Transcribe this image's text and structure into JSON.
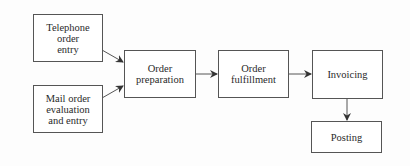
{
  "diagram": {
    "type": "flowchart",
    "nodes": [
      {
        "id": "telephone",
        "label": "Telephone\norder\nentry"
      },
      {
        "id": "mail",
        "label": "Mail order\nevaluation\nand entry"
      },
      {
        "id": "prep",
        "label": "Order\npreparation"
      },
      {
        "id": "fulfill",
        "label": "Order\nfulfillment"
      },
      {
        "id": "invoice",
        "label": "Invoicing"
      },
      {
        "id": "posting",
        "label": "Posting"
      }
    ],
    "edges": [
      {
        "from": "telephone",
        "to": "prep"
      },
      {
        "from": "mail",
        "to": "prep"
      },
      {
        "from": "prep",
        "to": "fulfill"
      },
      {
        "from": "fulfill",
        "to": "invoice"
      },
      {
        "from": "invoice",
        "to": "posting"
      }
    ],
    "colors": {
      "stroke": "#555555",
      "text": "#2a2a2a",
      "background": "#ffffff"
    }
  }
}
